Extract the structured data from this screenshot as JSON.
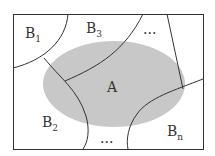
{
  "diagram": {
    "type": "partition-venn",
    "event_label": "A",
    "regions": [
      {
        "id": "B1",
        "base": "B",
        "sub": "1"
      },
      {
        "id": "B2",
        "base": "B",
        "sub": "2"
      },
      {
        "id": "B3",
        "base": "B",
        "sub": "3"
      },
      {
        "id": "Bn",
        "base": "B",
        "sub": "n"
      }
    ],
    "ellipsis_top": "...",
    "ellipsis_bottom": "...",
    "colors": {
      "ellipse_fill": "#c8c8c8",
      "stroke": "#333333",
      "background": "#ffffff"
    }
  }
}
